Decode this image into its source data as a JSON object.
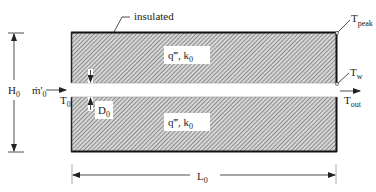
{
  "diagram": {
    "labels": {
      "insulated": "insulated",
      "t_peak": "T",
      "t_peak_sub": "peak",
      "t_w": "T",
      "t_w_sub": "w",
      "t_out": "T",
      "t_out_sub": "out",
      "t_0": "T",
      "t_0_sub": "0",
      "h_0": "H",
      "h_0_sub": "0",
      "m_dot": "ṁ'",
      "m_dot_sub": "0",
      "d_0": "D",
      "d_0_sub": "0",
      "l_0": "L",
      "l_0_sub": "0",
      "top_plate": "q‴, k",
      "top_plate_sub": "0",
      "bottom_plate": "q‴, k",
      "bottom_plate_sub": "0"
    },
    "colors": {
      "hatch": "#8a8a8a",
      "outline": "#222222",
      "background": "#ffffff"
    }
  }
}
